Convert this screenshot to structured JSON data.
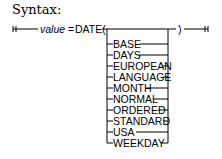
{
  "heading": "Syntax:",
  "diagram": {
    "variable": "value",
    "equals": "=",
    "function": "DATE(",
    "close": ")",
    "options": [
      "BASE",
      "DAYS",
      "EUROPEAN",
      "LANGUAGE",
      "MONTH",
      "NORMAL",
      "ORDERED",
      "STANDARD",
      "USA",
      "WEEKDAY"
    ]
  }
}
